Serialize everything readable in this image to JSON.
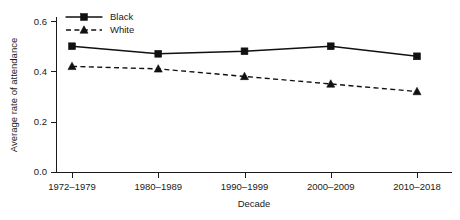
{
  "chart_data": {
    "type": "line",
    "title": "",
    "xlabel": "Decade",
    "ylabel": "Average rate of attendance",
    "categories": [
      "1972–1979",
      "1980–1989",
      "1990–1999",
      "2000–2009",
      "2010–2018"
    ],
    "yticks": [
      "0.0",
      "0.2",
      "0.4",
      "0.6"
    ],
    "ytick_values": [
      0.0,
      0.2,
      0.4,
      0.6
    ],
    "ylim": [
      0.0,
      0.63
    ],
    "grid": false,
    "legend_position": "top-left-inside",
    "series": [
      {
        "name": "Black",
        "values": [
          0.5,
          0.47,
          0.48,
          0.5,
          0.46
        ],
        "linestyle": "solid",
        "marker": "square",
        "color": "#111111"
      },
      {
        "name": "White",
        "values": [
          0.42,
          0.41,
          0.38,
          0.35,
          0.32
        ],
        "linestyle": "dashed",
        "marker": "triangle",
        "color": "#111111"
      }
    ]
  },
  "legend": {
    "entries": [
      {
        "label": "Black"
      },
      {
        "label": "White"
      }
    ]
  },
  "axes": {
    "x_title": "Decade",
    "y_title": "Average rate of attendance"
  }
}
